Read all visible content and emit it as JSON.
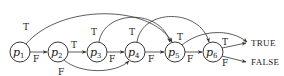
{
  "diagram": {
    "type": "control-flow-graph",
    "nodes": [
      {
        "id": "p1",
        "base": "p",
        "sub": "1",
        "x": 20,
        "y": 52
      },
      {
        "id": "p2",
        "base": "p",
        "sub": "2",
        "x": 58,
        "y": 52
      },
      {
        "id": "p3",
        "base": "p",
        "sub": "3",
        "x": 97,
        "y": 52
      },
      {
        "id": "p4",
        "base": "p",
        "sub": "4",
        "x": 135,
        "y": 52
      },
      {
        "id": "p5",
        "base": "p",
        "sub": "5",
        "x": 175,
        "y": 52
      },
      {
        "id": "p6",
        "base": "p",
        "sub": "6",
        "x": 213,
        "y": 52
      }
    ],
    "terminals": [
      {
        "id": "true",
        "label": "TRUE"
      },
      {
        "id": "false",
        "label": "FALSE"
      }
    ],
    "edges": [
      {
        "from": "p1",
        "to": "p5",
        "label": "T"
      },
      {
        "from": "p1",
        "to": "p2",
        "label": "F"
      },
      {
        "from": "p2",
        "to": "p3",
        "label": "T"
      },
      {
        "from": "p2",
        "to": "p4",
        "label": "F"
      },
      {
        "from": "p3",
        "to": "p5",
        "label": "T"
      },
      {
        "from": "p3",
        "to": "p4",
        "label": "F"
      },
      {
        "from": "p4",
        "to": "p6",
        "label": "T"
      },
      {
        "from": "p4",
        "to": "p5",
        "label": "F"
      },
      {
        "from": "p5",
        "to": "TRUE",
        "label": "T"
      },
      {
        "from": "p5",
        "to": "p6",
        "label": "F"
      },
      {
        "from": "p6",
        "to": "TRUE",
        "label": "T"
      },
      {
        "from": "p6",
        "to": "FALSE",
        "label": "F"
      }
    ],
    "labels": {
      "T": "T",
      "F": "F"
    }
  }
}
